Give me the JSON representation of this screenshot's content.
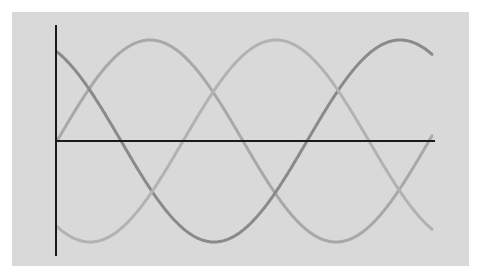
{
  "chart_data": {
    "type": "line",
    "title": "",
    "xlabel": "",
    "ylabel": "",
    "grid": false,
    "legend": null,
    "x_range_degrees": [
      0,
      360
    ],
    "ylim": [
      -1,
      1
    ],
    "background_color": "#d9d9d9",
    "axis_color": "#1a1a1a",
    "series": [
      {
        "name": "wave-1",
        "description": "sine wave starting at zero",
        "formula": "sin(theta)",
        "phase_deg": 0,
        "color": "#a8a8a8",
        "points_deg": [
          [
            0,
            0
          ],
          [
            90,
            1
          ],
          [
            180,
            0
          ],
          [
            270,
            -1
          ],
          [
            360,
            0
          ]
        ]
      },
      {
        "name": "wave-2",
        "description": "phase-shifted wave starting high, darkest line",
        "formula": "cos(theta - 332deg)",
        "phase_deg": 332,
        "color": "#8a8a8a",
        "points_deg": [
          [
            0,
            0.88
          ],
          [
            62,
            0
          ],
          [
            152,
            -1
          ],
          [
            242,
            0
          ],
          [
            332,
            1
          ],
          [
            360,
            0.83
          ]
        ]
      },
      {
        "name": "wave-3",
        "description": "phase-shifted wave starting low",
        "formula": "-cos(theta - 32deg)",
        "phase_deg": 32,
        "color": "#b2b2b2",
        "points_deg": [
          [
            0,
            -0.85
          ],
          [
            32,
            -1
          ],
          [
            122,
            0
          ],
          [
            212,
            1
          ],
          [
            302,
            0
          ],
          [
            360,
            -0.85
          ]
        ]
      }
    ]
  },
  "plot": {
    "origin_px": [
      57,
      141
    ],
    "x_end_px": 432,
    "period_px": 372,
    "amplitude_px": 101,
    "y_axis_top_px": 25,
    "y_axis_bottom_px": 256,
    "x_axis_end_px": 435
  }
}
